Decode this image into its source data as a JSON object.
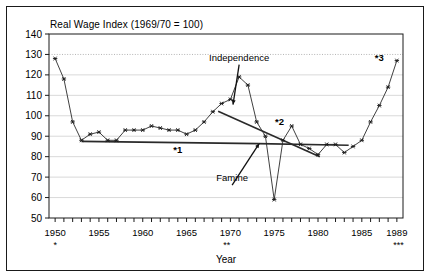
{
  "chart_data": {
    "type": "line",
    "title": "Real Wage Index (1969/70 = 100)",
    "xlabel": "Year",
    "ylabel": "",
    "xlim": [
      1949.3,
      1989.7
    ],
    "ylim": [
      50,
      140
    ],
    "ytick_step": 10,
    "grid": true,
    "legend": "none",
    "x": [
      1950,
      1951,
      1952,
      1953,
      1954,
      1955,
      1956,
      1957,
      1958,
      1959,
      1960,
      1961,
      1962,
      1963,
      1964,
      1965,
      1966,
      1967,
      1968,
      1969,
      1970,
      1971,
      1972,
      1973,
      1974,
      1975,
      1976,
      1977,
      1978,
      1979,
      1980,
      1981,
      1982,
      1983,
      1984,
      1985,
      1986,
      1987,
      1988,
      1989
    ],
    "values": [
      128,
      118,
      97,
      88,
      91,
      92,
      88,
      88,
      93,
      93,
      93,
      95,
      94,
      93,
      93,
      91,
      93,
      97,
      102,
      106,
      108,
      119,
      115,
      97,
      90,
      59,
      88,
      95,
      86,
      84,
      81,
      86,
      86,
      82,
      85,
      88,
      97,
      105,
      114,
      127
    ],
    "ytick_labels": [
      "50",
      "60",
      "70",
      "80",
      "90",
      "100",
      "110",
      "120",
      "130",
      "140"
    ],
    "xtick_labels_major": [
      "1950",
      "1955",
      "1960",
      "1965",
      "1970",
      "1975",
      "1980",
      "1985",
      "1989"
    ],
    "xtick_values_major": [
      1950,
      1955,
      1960,
      1965,
      1970,
      1975,
      1980,
      1985,
      1989
    ],
    "annotations": [
      {
        "name": "independence",
        "label": "Independence",
        "x": 1971.0,
        "y": 127.0,
        "arrow_to_x": 1970.3,
        "arrow_to_y": 105.5
      },
      {
        "name": "famine",
        "label": "Famine",
        "x": 1970.2,
        "y": 68.0,
        "arrow_to_x": 1973.3,
        "arrow_to_y": 86.5
      },
      {
        "name": "marker-1",
        "label": "*1",
        "x": 1964.0,
        "y": 82.0
      },
      {
        "name": "marker-2",
        "label": "*2",
        "x": 1975.6,
        "y": 95.5
      },
      {
        "name": "marker-3",
        "label": "*3",
        "x": 1987.0,
        "y": 127.0
      }
    ],
    "trend_lines": [
      {
        "name": "trend-1",
        "x1": 1953,
        "y1": 87.5,
        "x2": 1973.2,
        "y2": 86.4
      },
      {
        "name": "trend-2",
        "x1": 1968.6,
        "y1": 102.2,
        "x2": 1980.2,
        "y2": 80.0
      },
      {
        "name": "trend-3",
        "x1": 1973.2,
        "y1": 86.4,
        "x2": 1983.5,
        "y2": 85.6
      }
    ],
    "footnotes": [
      {
        "name": "footnote-1",
        "label": "*",
        "x": 1950
      },
      {
        "name": "footnote-2",
        "label": "**",
        "x": 1969.6
      },
      {
        "name": "footnote-3",
        "label": "***",
        "x": 1989.2
      }
    ],
    "colors": {
      "line": "#2a2a2a",
      "marker": "#1a1a1a",
      "grid": "#c9c9c9",
      "grid_dotted": "#b4b4b4",
      "axis": "#1a1a1a",
      "frame": "#1a1a1a",
      "plot_bg": "#ffffff",
      "trend": "#2a2a2a"
    }
  }
}
